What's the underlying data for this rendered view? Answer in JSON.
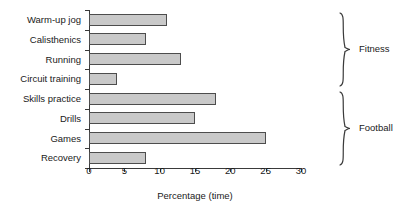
{
  "chart_data": {
    "type": "bar",
    "orientation": "horizontal",
    "title": "",
    "xlabel": "Percentage (time)",
    "ylabel": "",
    "xlim": [
      0,
      30
    ],
    "xticks": [
      0,
      5,
      10,
      15,
      20,
      25,
      30
    ],
    "grid": false,
    "legend": null,
    "categories": [
      "Warm-up jog",
      "Calisthenics",
      "Running",
      "Circuit training",
      "Skills practice",
      "Drills",
      "Games",
      "Recovery"
    ],
    "values": [
      11,
      8,
      13,
      4,
      18,
      15,
      25,
      8
    ],
    "groups": [
      {
        "label": "Fitness",
        "categories": [
          "Warm-up jog",
          "Calisthenics",
          "Running",
          "Circuit training"
        ]
      },
      {
        "label": "Football",
        "categories": [
          "Skills practice",
          "Drills",
          "Games",
          "Recovery"
        ]
      }
    ],
    "bar_color": "#c9c9c9",
    "bar_edge_color": "#4d4d4d",
    "axis_color": "#3a3a3a"
  }
}
